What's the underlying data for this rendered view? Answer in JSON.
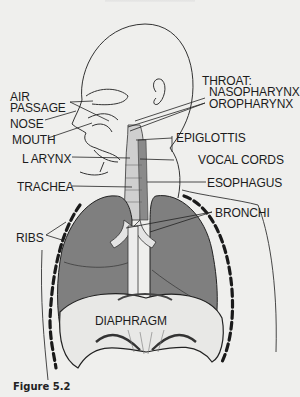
{
  "figure": {
    "caption": "Figure 5.2",
    "colors": {
      "background": "#efefed",
      "lung_fill": "#7f7f7f",
      "line": "#222222",
      "rib_dash": "#1a1a1a"
    }
  },
  "labels": {
    "air_passage_1": "AIR",
    "air_passage_2": "PASSAGE",
    "nose": "NOSE",
    "mouth": "MOUTH",
    "larynx": "L ARYNX",
    "trachea": "TRACHEA",
    "ribs": "RIBS",
    "throat": "THROAT:",
    "nasopharynx": "NASOPHARYNX",
    "oropharynx": "OROPHARYNX",
    "epiglottis": "EPIGLOTTIS",
    "vocal_cords": "VOCAL CORDS",
    "esophagus": "ESOPHAGUS",
    "bronchi": "BRONCHI",
    "diaphragm": "DIAPHRAGM"
  }
}
